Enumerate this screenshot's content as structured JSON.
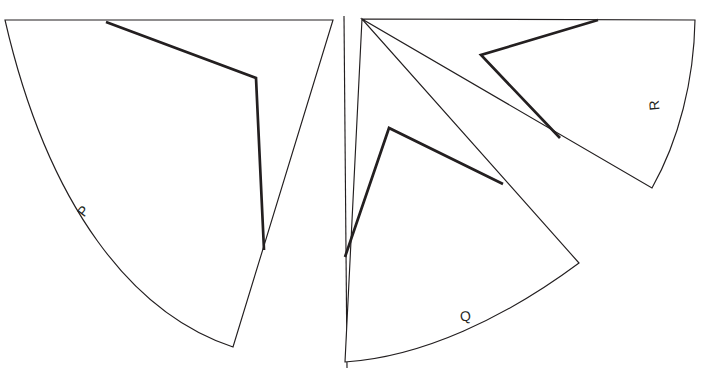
{
  "figure": {
    "canvas": {
      "width": 728,
      "height": 371,
      "background": "#ffffff"
    },
    "stroke_color": "#231f20",
    "labels": {
      "p": "P",
      "q": "Q",
      "r": "R"
    },
    "label_positions": {
      "p": {
        "x": 87,
        "y": 214,
        "rotation": -52
      },
      "q": {
        "x": 466,
        "y": 321,
        "rotation": -6
      },
      "r": {
        "x": 659,
        "y": 105,
        "rotation": -95
      }
    },
    "shapes": [
      {
        "name": "sector-p",
        "label": "P",
        "apex": {
          "x": 5,
          "y": 20
        },
        "outline": "M 5 20 L 333 20 L 233 347 C 133 314 48 207 5 20 Z",
        "chord": "M 106 22 L 256 78 L 264 250",
        "arc_from": {
          "x": 233,
          "y": 347
        },
        "arc_to": {
          "x": 5,
          "y": 20
        }
      },
      {
        "name": "sector-q",
        "label": "Q",
        "apex": {
          "x": 345,
          "y": 362
        },
        "outline": "M 345 362 L 362 19 L 579 263 C 505 318 422 357 345 362 Z",
        "chord": "M 345 257 L 389 128 L 503 184",
        "arc_from": {
          "x": 579,
          "y": 263
        },
        "arc_to": {
          "x": 345,
          "y": 362
        }
      },
      {
        "name": "sector-r",
        "label": "R",
        "apex": {
          "x": 362,
          "y": 19
        },
        "outline": "M 362 19 L 695 20 C 694 80 679 140 652 188 L 362 19 Z",
        "chord": "M 598 20 L 481 55 L 560 138",
        "arc_from": {
          "x": 695,
          "y": 20
        },
        "arc_to": {
          "x": 652,
          "y": 188
        }
      }
    ],
    "divider": {
      "name": "panel-divider",
      "x1": 344,
      "y1": 16,
      "x2": 347,
      "y2": 368
    }
  }
}
